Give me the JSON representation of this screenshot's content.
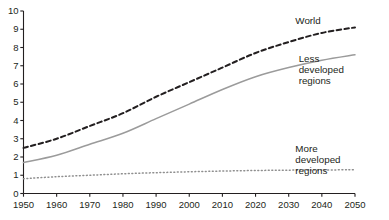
{
  "chart_data": {
    "type": "line",
    "title": "",
    "subtitle": "",
    "xlabel": "",
    "ylabel": "",
    "xlim": [
      1950,
      2050
    ],
    "ylim": [
      0,
      10
    ],
    "grid": false,
    "legend_position": "inline-right",
    "x_ticks": [
      "1950",
      "1960",
      "1970",
      "1980",
      "1990",
      "2000",
      "2010",
      "2020",
      "2030",
      "2040",
      "2050"
    ],
    "y_ticks": [
      "0",
      "1",
      "2",
      "3",
      "4",
      "5",
      "6",
      "7",
      "8",
      "9",
      "10"
    ],
    "x": [
      1950,
      1960,
      1970,
      1980,
      1990,
      2000,
      2010,
      2020,
      2030,
      2040,
      2050
    ],
    "series": [
      {
        "name": "World",
        "style": "dashed",
        "color": "#231f20",
        "values": [
          2.5,
          3.0,
          3.7,
          4.4,
          5.3,
          6.1,
          6.9,
          7.7,
          8.3,
          8.8,
          9.1
        ]
      },
      {
        "name": "Less developed regions",
        "style": "solid",
        "color": "#9b9b9b",
        "values": [
          1.7,
          2.1,
          2.7,
          3.3,
          4.1,
          4.9,
          5.7,
          6.4,
          6.9,
          7.3,
          7.6
        ]
      },
      {
        "name": "More developed regions",
        "style": "dotted",
        "color": "#8f8f8f",
        "values": [
          0.81,
          0.92,
          1.0,
          1.08,
          1.14,
          1.19,
          1.23,
          1.26,
          1.28,
          1.29,
          1.3
        ]
      }
    ],
    "annotations": [
      {
        "text": "World",
        "x": 2032,
        "y": 9.45
      },
      {
        "text": "Less",
        "x": 2033,
        "y": 7.35
      },
      {
        "text": "developed",
        "x": 2033,
        "y": 6.75
      },
      {
        "text": "regions",
        "x": 2033,
        "y": 6.15
      },
      {
        "text": "More",
        "x": 2032,
        "y": 2.45
      },
      {
        "text": "developed",
        "x": 2032,
        "y": 1.85
      },
      {
        "text": "regions",
        "x": 2032,
        "y": 1.25
      }
    ],
    "axis_color": "#231f20",
    "background": "#ffffff"
  }
}
